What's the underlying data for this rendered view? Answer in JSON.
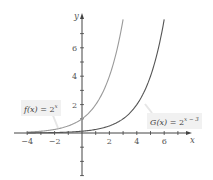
{
  "chart_data": {
    "type": "line",
    "title": "",
    "xlabel": "x",
    "ylabel": "y",
    "xlim": [
      -5,
      7.5
    ],
    "ylim": [
      -4.5,
      8
    ],
    "grid": false,
    "x_ticks": [
      -4,
      -3,
      -2,
      -1,
      1,
      2,
      3,
      4,
      5,
      6,
      7
    ],
    "x_tick_labels": [
      "-4",
      "-2",
      "2",
      "4",
      "6"
    ],
    "x_tick_label_values": [
      -4,
      -2,
      2,
      4,
      6
    ],
    "y_ticks": [
      -3,
      -2,
      -1,
      1,
      2,
      3,
      4,
      5,
      6,
      7
    ],
    "y_tick_labels": [
      "2",
      "4",
      "6"
    ],
    "y_tick_label_values": [
      2,
      4,
      6
    ],
    "series": [
      {
        "name": "f(x) = 2^x",
        "label_func": "f(x)",
        "label_base": "2",
        "label_exp": "x",
        "color": "#9a9a9a",
        "x": [
          -4,
          -3,
          -2,
          -1,
          0,
          1,
          2,
          2.5,
          3
        ],
        "values": [
          0.0625,
          0.125,
          0.25,
          0.5,
          1,
          2,
          4,
          5.66,
          8
        ]
      },
      {
        "name": "G(x) = 2^(x-3)",
        "label_func": "G(x)",
        "label_base": "2",
        "label_exp": "x − 3",
        "color": "#555555",
        "x": [
          -4,
          -2,
          0,
          1,
          2,
          3,
          4,
          5,
          5.5,
          6
        ],
        "values": [
          0.0078,
          0.031,
          0.125,
          0.25,
          0.5,
          1,
          2,
          4,
          5.66,
          8
        ]
      }
    ],
    "annotations": [
      {
        "text": "f(x) = 2^x",
        "points_to": [
          -1.5,
          0.35
        ]
      },
      {
        "text": "G(x) = 2^(x-3)",
        "points_to": [
          4.7,
          3.2
        ]
      }
    ]
  }
}
